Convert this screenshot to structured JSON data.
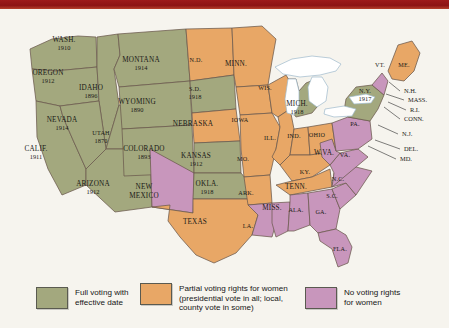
{
  "map": {
    "title": "Woman Suffrage Before the Nineteenth Amendment",
    "colors": {
      "full": "#a3a87e",
      "partial": "#e8a766",
      "none": "#c896bc",
      "water": "#ffffff",
      "border": "#6b5a4e",
      "background": "#f6f4ee",
      "top_band": "#9e1b1b"
    },
    "states": [
      {
        "id": "WA",
        "name": "WASH.",
        "date": "1910",
        "status": "full",
        "lx": 64,
        "ly": 33
      },
      {
        "id": "OR",
        "name": "OREGON",
        "date": "1912",
        "status": "full",
        "lx": 48,
        "ly": 66
      },
      {
        "id": "CA",
        "name": "CALIF.",
        "date": "1911",
        "status": "full",
        "lx": 36,
        "ly": 142
      },
      {
        "id": "ID",
        "name": "IDAHO",
        "date": "1896",
        "status": "full",
        "lx": 91,
        "ly": 81
      },
      {
        "id": "NV",
        "name": "NEVADA",
        "date": "1914",
        "status": "full",
        "lx": 62,
        "ly": 113
      },
      {
        "id": "UT",
        "name": "UTAH",
        "date": "1870",
        "status": "full",
        "lx": 101,
        "ly": 126
      },
      {
        "id": "AZ",
        "name": "ARIZONA",
        "date": "1912",
        "status": "full",
        "lx": 93,
        "ly": 177
      },
      {
        "id": "MT",
        "name": "MONTANA",
        "date": "1914",
        "status": "full",
        "lx": 141,
        "ly": 53
      },
      {
        "id": "WY",
        "name": "WYOMING",
        "date": "1890",
        "status": "full",
        "lx": 137,
        "ly": 95
      },
      {
        "id": "CO",
        "name": "COLORADO",
        "date": "1893",
        "status": "full",
        "lx": 144,
        "ly": 142
      },
      {
        "id": "NM",
        "name": "NEW MEXICO",
        "date": "",
        "status": "none",
        "lx": 144,
        "ly": 180
      },
      {
        "id": "ND",
        "name": "N.D.",
        "date": "",
        "status": "partial",
        "lx": 196,
        "ly": 53
      },
      {
        "id": "SD",
        "name": "S.D.",
        "date": "1918",
        "status": "full",
        "lx": 195,
        "ly": 82
      },
      {
        "id": "NE",
        "name": "NEBRASKA",
        "date": "",
        "status": "partial",
        "lx": 193,
        "ly": 117
      },
      {
        "id": "KS",
        "name": "KANSAS",
        "date": "1912",
        "status": "full",
        "lx": 196,
        "ly": 149
      },
      {
        "id": "OK",
        "name": "OKLA.",
        "date": "1918",
        "status": "full",
        "lx": 207,
        "ly": 177
      },
      {
        "id": "TX",
        "name": "TEXAS",
        "date": "",
        "status": "partial",
        "lx": 195,
        "ly": 215
      },
      {
        "id": "MN",
        "name": "MINN.",
        "date": "",
        "status": "partial",
        "lx": 236,
        "ly": 57
      },
      {
        "id": "IA",
        "name": "IOWA",
        "date": "",
        "status": "partial",
        "lx": 240,
        "ly": 113
      },
      {
        "id": "MO",
        "name": "MO.",
        "date": "",
        "status": "partial",
        "lx": 243,
        "ly": 152
      },
      {
        "id": "AR",
        "name": "ARK.",
        "date": "",
        "status": "partial",
        "lx": 246,
        "ly": 186
      },
      {
        "id": "LA",
        "name": "LA.",
        "date": "",
        "status": "none",
        "lx": 248,
        "ly": 219
      },
      {
        "id": "WI",
        "name": "WIS.",
        "date": "",
        "status": "partial",
        "lx": 265,
        "ly": 81
      },
      {
        "id": "IL",
        "name": "ILL.",
        "date": "",
        "status": "partial",
        "lx": 270,
        "ly": 131
      },
      {
        "id": "MS",
        "name": "MISS.",
        "date": "",
        "status": "none",
        "lx": 272,
        "ly": 201
      },
      {
        "id": "MI",
        "name": "MICH.",
        "date": "1918",
        "status": "full",
        "lx": 297,
        "ly": 97
      },
      {
        "id": "IN",
        "name": "IND.",
        "date": "",
        "status": "partial",
        "lx": 294,
        "ly": 129
      },
      {
        "id": "OH",
        "name": "OHIO",
        "date": "",
        "status": "partial",
        "lx": 317,
        "ly": 128
      },
      {
        "id": "KY",
        "name": "KY.",
        "date": "",
        "status": "partial",
        "lx": 305,
        "ly": 165
      },
      {
        "id": "TN",
        "name": "TENN.",
        "date": "",
        "status": "partial",
        "lx": 296,
        "ly": 180
      },
      {
        "id": "AL",
        "name": "ALA.",
        "date": "",
        "status": "none",
        "lx": 296,
        "ly": 203
      },
      {
        "id": "GA",
        "name": "GA.",
        "date": "",
        "status": "none",
        "lx": 321,
        "ly": 205
      },
      {
        "id": "FL",
        "name": "FLA.",
        "date": "",
        "status": "none",
        "lx": 340,
        "ly": 242
      },
      {
        "id": "SC",
        "name": "S.C.",
        "date": "",
        "status": "none",
        "lx": 332,
        "ly": 189
      },
      {
        "id": "NC",
        "name": "N.C.",
        "date": "",
        "status": "none",
        "lx": 338,
        "ly": 172
      },
      {
        "id": "VA",
        "name": "VA.",
        "date": "",
        "status": "none",
        "lx": 345,
        "ly": 148
      },
      {
        "id": "WV",
        "name": "W.VA.",
        "date": "",
        "status": "none",
        "lx": 324,
        "ly": 146
      },
      {
        "id": "PA",
        "name": "PA.",
        "date": "",
        "status": "none",
        "lx": 355,
        "ly": 117
      },
      {
        "id": "NY",
        "name": "N.Y.",
        "date": "1917",
        "status": "full",
        "lx": 365,
        "ly": 84
      },
      {
        "id": "VT",
        "name": "VT.",
        "date": "",
        "status": "none",
        "lx": 380,
        "ly": 58
      },
      {
        "id": "ME",
        "name": "ME.",
        "date": "",
        "status": "partial",
        "lx": 404,
        "ly": 58
      }
    ],
    "callouts": [
      {
        "id": "NH",
        "label": "N.H.",
        "tx": 404,
        "ty": 84,
        "x1": 400,
        "y1": 82,
        "x2": 389,
        "y2": 73
      },
      {
        "id": "MASS",
        "label": "MASS.",
        "tx": 408,
        "ty": 93,
        "x1": 404,
        "y1": 91,
        "x2": 386,
        "y2": 85
      },
      {
        "id": "RI",
        "label": "R.I.",
        "tx": 410,
        "ty": 103,
        "x1": 406,
        "y1": 101,
        "x2": 388,
        "y2": 93
      },
      {
        "id": "CONN",
        "label": "CONN.",
        "tx": 404,
        "ty": 112,
        "x1": 400,
        "y1": 110,
        "x2": 384,
        "y2": 98
      },
      {
        "id": "NJ",
        "label": "N.J.",
        "tx": 402,
        "ty": 127,
        "x1": 398,
        "y1": 125,
        "x2": 378,
        "y2": 116
      },
      {
        "id": "DEL",
        "label": "DEL.",
        "tx": 404,
        "ty": 142,
        "x1": 400,
        "y1": 140,
        "x2": 375,
        "y2": 131
      },
      {
        "id": "MD",
        "label": "MD.",
        "tx": 400,
        "ty": 152,
        "x1": 396,
        "y1": 150,
        "x2": 368,
        "y2": 137
      }
    ]
  },
  "legend": {
    "items": [
      {
        "key": "full",
        "color": "#a3a87e",
        "text": "Full voting with\neffective date"
      },
      {
        "key": "partial",
        "color": "#e8a766",
        "text": "Partial voting rights for women\n(presidential vote in all; local,\ncounty vote in some)"
      },
      {
        "key": "none",
        "color": "#c896bc",
        "text": "No voting rights\nfor women"
      }
    ]
  }
}
